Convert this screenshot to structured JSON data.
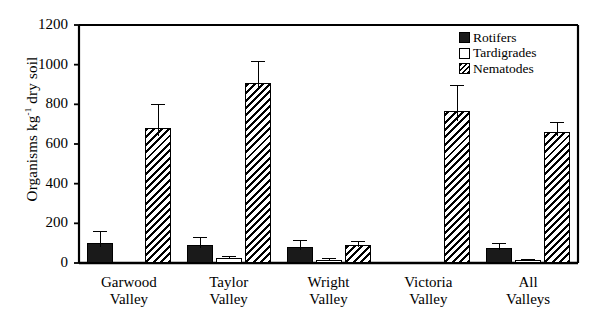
{
  "chart_data": {
    "type": "bar",
    "title": "",
    "xlabel": "",
    "ylabel": "Organisms kg⁻¹ dry soil",
    "ylabel_main": "Organisms kg",
    "ylabel_sup": "-1",
    "ylabel_tail": " dry soil",
    "ylim": [
      0,
      1200
    ],
    "ytick_values": [
      0,
      200,
      400,
      600,
      800,
      1000,
      1200
    ],
    "ytick_labels": [
      "0",
      "200",
      "400",
      "600",
      "800",
      "1000",
      "1200"
    ],
    "grid": false,
    "legend_position": "top-right",
    "categories": [
      "Garwood Valley",
      "Taylor Valley",
      "Wright Valley",
      "Victoria Valley",
      "All Valleys"
    ],
    "category_lines": [
      [
        "Garwood",
        "Valley"
      ],
      [
        "Taylor",
        "Valley"
      ],
      [
        "Wright",
        "Valley"
      ],
      [
        "Victoria",
        "Valley"
      ],
      [
        "All",
        "Valleys"
      ]
    ],
    "series": [
      {
        "name": "Rotifers",
        "fill": "solid",
        "values": [
          100,
          90,
          80,
          4,
          75
        ],
        "errors": [
          60,
          40,
          35,
          3,
          28
        ]
      },
      {
        "name": "Tardigrades",
        "fill": "open",
        "values": [
          5,
          25,
          15,
          3,
          15
        ],
        "errors": [
          0,
          10,
          8,
          0,
          7
        ]
      },
      {
        "name": "Nematodes",
        "fill": "hatch",
        "values": [
          680,
          910,
          90,
          765,
          660
        ],
        "errors": [
          120,
          110,
          22,
          135,
          52
        ]
      }
    ]
  },
  "legend": {
    "entries": [
      {
        "label": "Rotifers",
        "fill": "solid"
      },
      {
        "label": "Tardigrades",
        "fill": "open"
      },
      {
        "label": "Nematodes",
        "fill": "hatch"
      }
    ]
  }
}
